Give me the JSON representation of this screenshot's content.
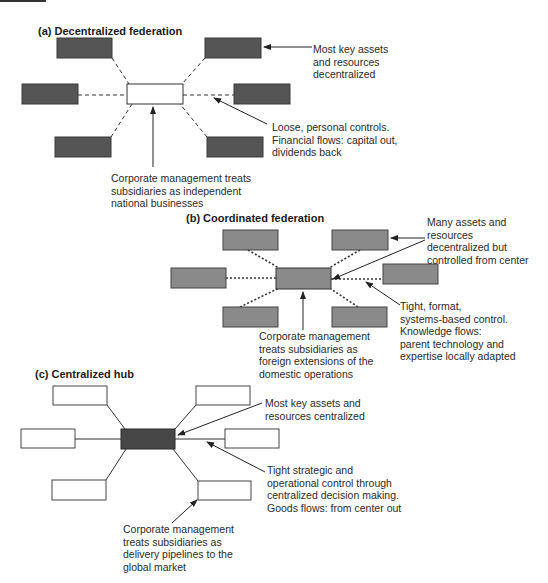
{
  "colors": {
    "a_box": "#555555",
    "b_box": "#8a8a8a",
    "c_center": "#474747",
    "c_box": "#ffffff",
    "line": "#333333"
  },
  "sections": {
    "a": {
      "title": "(a) Decentralized federation",
      "notes": {
        "assets": [
          "Most key assets",
          "and resources",
          "decentralized"
        ],
        "controls": [
          "Loose, personal controls.",
          "Financial flows: capital out,",
          "dividends back"
        ],
        "management": [
          "Corporate management treats",
          "subsidiaries as independent",
          "national businesses"
        ]
      }
    },
    "b": {
      "title": "(b) Coordinated federation",
      "notes": {
        "assets": [
          "Many assets and",
          "resources",
          "decentralized but",
          "controlled from center"
        ],
        "controls": [
          "Tight, format,",
          "systems-based control.",
          "Knowledge flows:",
          "parent technology and",
          "expertise locally adapted"
        ],
        "management": [
          "Corporate management",
          "treats subsidiaries as",
          "foreign extensions of the",
          "domestic operations"
        ]
      }
    },
    "c": {
      "title": "(c) Centralized hub",
      "notes": {
        "assets": [
          "Most key assets and",
          "resources centralized"
        ],
        "controls": [
          "Tight strategic and",
          "operational control through",
          "centralized decision making.",
          "Goods flows: from center out"
        ],
        "management": [
          "Corporate management",
          "treats subsidiaries as",
          "delivery pipelines to the",
          "global market"
        ]
      }
    }
  }
}
